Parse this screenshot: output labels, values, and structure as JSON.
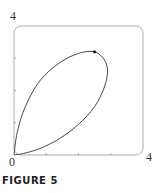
{
  "figure": {
    "caption": "FIGURE 5"
  },
  "chart_data": {
    "type": "line",
    "title": "",
    "xlabel": "",
    "ylabel": "",
    "xlim": [
      0,
      4
    ],
    "ylim": [
      0,
      4
    ],
    "tick_labels": {
      "x_min": "0",
      "x_max": "4",
      "y_max": "4"
    },
    "ticks": {
      "x": [
        1,
        2,
        3
      ],
      "y": [
        1,
        2,
        3
      ]
    },
    "grid": false,
    "series": [
      {
        "name": "closed curve (loop through origin)",
        "points": [
          [
            0,
            0
          ],
          [
            0.3,
            0.05
          ],
          [
            0.8,
            0.2
          ],
          [
            1.4,
            0.5
          ],
          [
            2.0,
            0.95
          ],
          [
            2.5,
            1.5
          ],
          [
            2.8,
            2.1
          ],
          [
            2.9,
            2.6
          ],
          [
            2.8,
            2.95
          ],
          [
            2.5,
            3.2
          ],
          [
            2.0,
            3.15
          ],
          [
            1.4,
            2.85
          ],
          [
            0.8,
            2.3
          ],
          [
            0.35,
            1.5
          ],
          [
            0.1,
            0.7
          ],
          [
            0,
            0
          ]
        ]
      }
    ],
    "marked_point": {
      "x": 2.5,
      "y": 3.2
    }
  }
}
